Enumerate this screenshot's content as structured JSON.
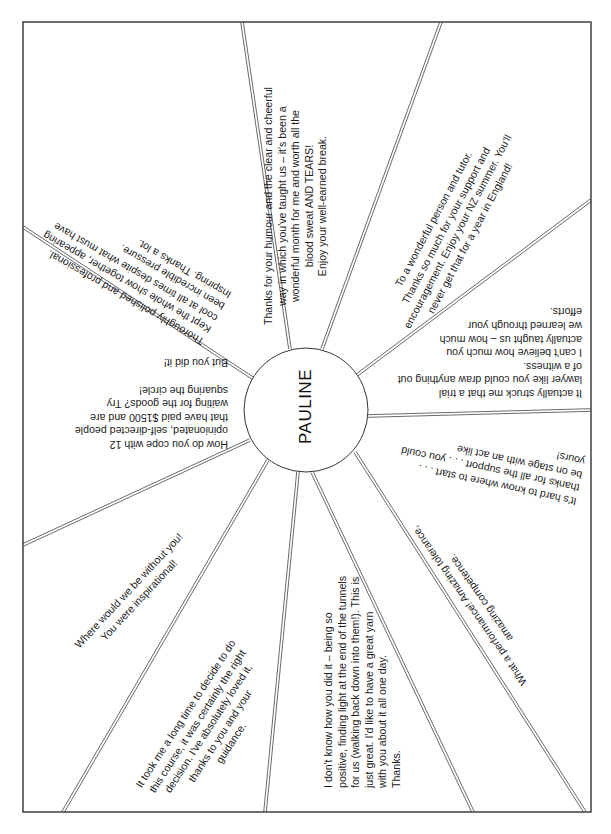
{
  "card": {
    "center_name": "PAULINE",
    "frame": {
      "left": 23,
      "top": 22,
      "right": 591,
      "bottom": 812,
      "stroke": "#333333"
    },
    "circle": {
      "cx": 306,
      "cy": 410,
      "r": 62,
      "stroke": "#333333"
    },
    "line_color": "#444444",
    "rays": [
      {
        "x1": 290,
        "y1": 349,
        "x2": 242,
        "y2": 22
      },
      {
        "x1": 322,
        "y1": 349,
        "x2": 441,
        "y2": 22
      },
      {
        "x1": 357,
        "y1": 375,
        "x2": 591,
        "y2": 200
      },
      {
        "x1": 368,
        "y1": 416,
        "x2": 591,
        "y2": 410
      },
      {
        "x1": 355,
        "y1": 452,
        "x2": 585,
        "y2": 812
      },
      {
        "x1": 312,
        "y1": 472,
        "x2": 473,
        "y2": 812
      },
      {
        "x1": 298,
        "y1": 472,
        "x2": 265,
        "y2": 812
      },
      {
        "x1": 268,
        "y1": 460,
        "x2": 63,
        "y2": 812
      },
      {
        "x1": 250,
        "y1": 440,
        "x2": 23,
        "y2": 545
      },
      {
        "x1": 254,
        "y1": 379,
        "x2": 23,
        "y2": 227
      }
    ],
    "messages": [
      {
        "id": "top-center",
        "x": 262,
        "y": 325,
        "rotate": -90,
        "align": "center",
        "lines": [
          "Thanks for your humour and the clear and cheerful",
          "way in which you've taught us – it's been a",
          "wonderful month for me and worth all the",
          "blood sweat AND TEARS!",
          "Enjoy your well-earned break."
        ]
      },
      {
        "id": "top-right",
        "x": 377,
        "y": 312,
        "rotate": -62,
        "align": "center",
        "lines": [
          "To a wonderful person and tutor.",
          "Thanks so much for your support and",
          "encouragement. Enjoy your NZ summer. You'll",
          "never get that for a year in England!"
        ]
      },
      {
        "id": "right-upper",
        "x": 582,
        "y": 400,
        "rotate": 180,
        "align": "left",
        "lines": [
          "It actually struck me that a trial",
          "lawyer like you could draw anything out",
          "of a witness.",
          "I can't believe how much you",
          "actually taught us – how much",
          "we learned through your",
          "efforts."
        ]
      },
      {
        "id": "right-lower",
        "x": 575,
        "y": 508,
        "rotate": 192,
        "align": "left",
        "lines": [
          "It's hard to know where to start . . .",
          "thanks for all the support . . . you could",
          "be on stage with an act like",
          "yours!"
        ]
      },
      {
        "id": "bottom-right",
        "x": 519,
        "y": 688,
        "rotate": 235,
        "align": "center",
        "lines": [
          "What a performance! Amazing tolerance,",
          "amazing competence."
        ]
      },
      {
        "id": "bottom-center",
        "x": 322,
        "y": 788,
        "rotate": -90,
        "align": "left",
        "lines": [
          "I don't know how you did it – being so",
          "positive, finding light at the end of the tunnels",
          "for us (walking back down into them!). This is",
          "just great. I'd like to have a great yarn",
          "with you about it all one day.",
          "Thanks."
        ]
      },
      {
        "id": "bottom-left",
        "x": 133,
        "y": 783,
        "rotate": -57,
        "align": "center",
        "lines": [
          "It took me a long time to decide to do",
          "this course, it was certainly the right",
          "decision. I've absolutely loved it,",
          "thanks to you and your",
          "guidance."
        ]
      },
      {
        "id": "left-lower",
        "x": 72,
        "y": 642,
        "rotate": -47,
        "align": "center",
        "lines": [
          "Where would we be without you!",
          "You were inspirational!"
        ]
      },
      {
        "id": "left-middle",
        "x": 228,
        "y": 451,
        "rotate": 180,
        "align": "left",
        "lines": [
          "How do you cope with 12",
          "opinionated, self-directed people",
          "that have paid $1500 and are",
          "waiting for the goods? Try",
          "squaring the circle!",
          "",
          "But you did it!"
        ]
      },
      {
        "id": "left-upper",
        "x": 200,
        "y": 348,
        "rotate": 210,
        "align": "left",
        "lines": [
          "Thoroughly polished and professional.",
          "Kept the whole show together, appearing",
          "cool at all times despite what must have",
          "been incredible pressure.",
          "Inspiring. Thanks a lot."
        ]
      }
    ]
  }
}
